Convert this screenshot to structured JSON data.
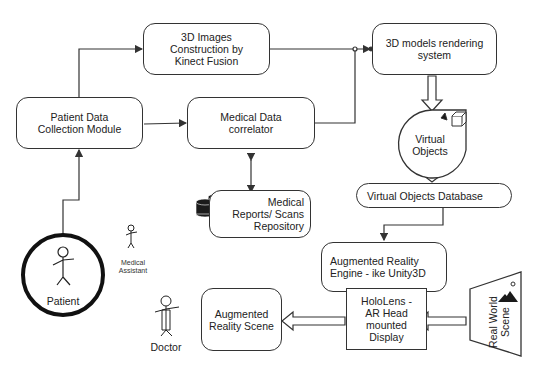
{
  "diagram": {
    "nodes": {
      "kinect": {
        "label_lines": [
          "3D Images",
          "Construction by",
          "Kinect Fusion"
        ]
      },
      "rendering": {
        "label_lines": [
          "3D models rendering",
          "system"
        ]
      },
      "patient_module": {
        "label_lines": [
          "Patient Data",
          "Collection Module"
        ]
      },
      "correlator": {
        "label_lines": [
          "Medical Data",
          "correlator"
        ]
      },
      "virtual_objects": {
        "label_lines": [
          "Virtual",
          "Objects"
        ]
      },
      "vo_database": {
        "label": "Virtual Objects Database"
      },
      "repository": {
        "label_lines": [
          "Medical",
          "Reports/ Scans",
          "Repository"
        ]
      },
      "ar_engine": {
        "label_lines": [
          "Augmented Reality",
          "Engine -  ike Unity3D"
        ]
      },
      "hololens": {
        "label_lines": [
          "HoloLens -",
          "AR Head",
          "mounted",
          "Display"
        ]
      },
      "ar_scene": {
        "label_lines": [
          "Augmented",
          "Reality Scene"
        ]
      },
      "real_world": {
        "label_lines": [
          "Real World",
          "Scene"
        ]
      }
    },
    "actors": {
      "patient": "Patient",
      "medical_assistant_lines": [
        "Medical",
        "Assistant"
      ],
      "doctor": "Doctor"
    },
    "icons": {
      "database": "database-stack-icon",
      "cube": "cube-icon",
      "scene": "landscape-icon"
    },
    "colors": {
      "stroke": "#333333",
      "fill": "#ffffff",
      "icon": "#1a1a1a"
    }
  }
}
